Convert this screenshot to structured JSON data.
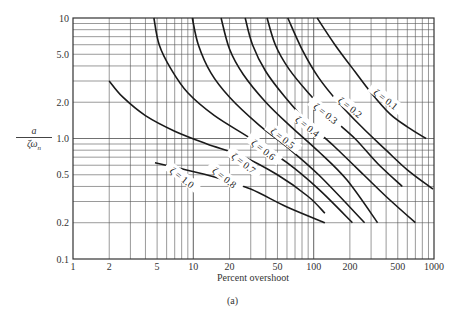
{
  "chart_data": {
    "type": "line",
    "title": "",
    "subtitle": "(a)",
    "xlabel": "Percent overshoot",
    "ylabel": "a / (ζ ω_n)",
    "xscale": "log",
    "yscale": "log",
    "xlim": [
      1,
      1000
    ],
    "ylim": [
      0.1,
      10
    ],
    "grid": true,
    "legend": "inline curve labels",
    "x_ticks": [
      "1",
      "2",
      "5",
      "10",
      "20",
      "50",
      "100",
      "200",
      "500",
      "1000"
    ],
    "y_ticks": [
      "0.1",
      "0.2",
      "0.5",
      "1.0",
      "2.0",
      "5.0",
      "10"
    ],
    "series": [
      {
        "name": "ζ = 0.1",
        "points": [
          [
            107,
            10
          ],
          [
            150,
            6
          ],
          [
            220,
            3.6
          ],
          [
            300,
            2.4
          ],
          [
            430,
            1.6
          ],
          [
            600,
            1.25
          ],
          [
            860,
            1.0
          ]
        ],
        "label_at": [
          395,
          2.1
        ]
      },
      {
        "name": "ζ = 0.2",
        "points": [
          [
            61,
            10
          ],
          [
            80,
            5.5
          ],
          [
            110,
            3.2
          ],
          [
            160,
            2.0
          ],
          [
            250,
            1.25
          ],
          [
            400,
            0.8
          ],
          [
            600,
            0.55
          ],
          [
            980,
            0.38
          ]
        ],
        "label_at": [
          200,
          1.8
        ]
      },
      {
        "name": "ζ = 0.3",
        "points": [
          [
            41,
            10
          ],
          [
            48,
            6
          ],
          [
            62,
            3.8
          ],
          [
            90,
            2.4
          ],
          [
            140,
            1.5
          ],
          [
            220,
            1.0
          ],
          [
            340,
            0.62
          ],
          [
            545,
            0.4
          ]
        ],
        "label_at": [
          125,
          1.6
        ]
      },
      {
        "name": "ζ = 0.4",
        "points": [
          [
            27,
            10
          ],
          [
            31,
            6
          ],
          [
            40,
            3.6
          ],
          [
            58,
            2.2
          ],
          [
            90,
            1.35
          ],
          [
            150,
            0.85
          ],
          [
            260,
            0.5
          ],
          [
            400,
            0.33
          ],
          [
            700,
            0.2
          ]
        ],
        "label_at": [
          88,
          1.25
        ]
      },
      {
        "name": "ζ = 0.5",
        "points": [
          [
            17,
            10
          ],
          [
            20,
            5.5
          ],
          [
            26,
            3.4
          ],
          [
            40,
            2.0
          ],
          [
            65,
            1.25
          ],
          [
            110,
            0.78
          ],
          [
            190,
            0.45
          ],
          [
            340,
            0.2
          ]
        ],
        "label_at": [
          55,
          1.0
        ]
      },
      {
        "name": "ζ = 0.6",
        "points": [
          [
            9.8,
            10
          ],
          [
            11,
            6
          ],
          [
            14,
            3.5
          ],
          [
            20,
            2.2
          ],
          [
            35,
            1.3
          ],
          [
            60,
            0.85
          ],
          [
            110,
            0.5
          ],
          [
            265,
            0.2
          ]
        ],
        "label_at": [
          38,
          0.8
        ]
      },
      {
        "name": "ζ = 0.7",
        "points": [
          [
            4.7,
            10
          ],
          [
            5.2,
            6
          ],
          [
            6.5,
            3.8
          ],
          [
            9,
            2.4
          ],
          [
            15,
            1.55
          ],
          [
            30,
            1.0
          ],
          [
            60,
            0.63
          ],
          [
            110,
            0.38
          ],
          [
            210,
            0.2
          ]
        ],
        "label_at": [
          26,
          0.62
        ]
      },
      {
        "name": "ζ = 0.8",
        "points": [
          [
            2,
            3.0
          ],
          [
            2.6,
            2.2
          ],
          [
            4,
            1.55
          ],
          [
            7,
            1.15
          ],
          [
            13,
            0.9
          ],
          [
            25,
            0.72
          ],
          [
            50,
            0.5
          ],
          [
            90,
            0.33
          ],
          [
            124,
            0.24
          ]
        ],
        "label_at": [
          18,
          0.47
        ]
      },
      {
        "name": "ζ = 1.0",
        "points": [
          [
            4.8,
            0.63
          ],
          [
            8,
            0.56
          ],
          [
            15,
            0.48
          ],
          [
            30,
            0.38
          ],
          [
            60,
            0.27
          ],
          [
            124,
            0.2
          ]
        ],
        "label_at": [
          8,
          0.47
        ]
      }
    ]
  },
  "axis": {
    "y_numerator": "a",
    "y_denominator": "ζω",
    "y_denominator_sub": "n",
    "x_title": "Percent overshoot"
  },
  "caption": "(a)"
}
